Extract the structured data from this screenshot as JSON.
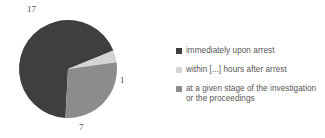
{
  "chart_data": {
    "type": "pie",
    "title": "",
    "subtitle": "",
    "xlabel": "",
    "ylabel": "",
    "categories": [
      "immediately upon arrest",
      "within [...] hours after arrest",
      "at a given stage of the investigation or the proceedings"
    ],
    "values": [
      17,
      1,
      7
    ],
    "total": 25,
    "data_labels": [
      "17",
      "1",
      "7"
    ],
    "colors": [
      "#3f3f3f",
      "#d4d4d4",
      "#8c8c8c"
    ],
    "legend_position": "right",
    "grid": false,
    "start_angle_deg": 0,
    "direction": "clockwise",
    "slices": [
      {
        "label": "immediately upon arrest",
        "value": 17,
        "data_label": "17",
        "color": "#3f3f3f",
        "percent": 68
      },
      {
        "label": "within [...] hours after arrest",
        "value": 1,
        "data_label": "1",
        "color": "#d4d4d4",
        "percent": 4
      },
      {
        "label": "at a given stage of the investigation or the proceedings",
        "value": 7,
        "data_label": "7",
        "color": "#8c8c8c",
        "percent": 28
      }
    ]
  },
  "legend": {
    "items": [
      {
        "label": "immediately upon arrest",
        "color": "#3f3f3f"
      },
      {
        "label": "within [...] hours after arrest",
        "color": "#d4d4d4"
      },
      {
        "label": "at a given stage of the investigation or the proceedings",
        "color": "#8c8c8c"
      }
    ]
  },
  "labels": {
    "slice_17": "17",
    "slice_1": "1",
    "slice_7": "7"
  }
}
